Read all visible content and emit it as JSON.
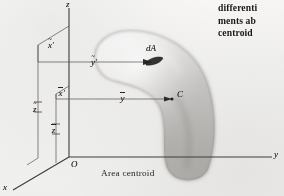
{
  "figure": {
    "caption": "Area centroid",
    "axes": [
      {
        "name": "z-axis",
        "label": "z"
      },
      {
        "name": "y-axis",
        "label": "y"
      },
      {
        "name": "x-axis",
        "label": "x"
      }
    ],
    "origin": {
      "label": "O"
    },
    "element": {
      "area_label": "dA",
      "x_label": "x",
      "y_label": "y",
      "z_label": "z",
      "x_accent": "~",
      "y_accent": "~",
      "z_accent": "~",
      "x_prime": "′",
      "y_prime": "′"
    },
    "centroid": {
      "point_label": "C",
      "x_label": "x",
      "y_label": "y",
      "z_label": "z",
      "x_accent": "–",
      "y_accent": "–",
      "z_accent": "–",
      "x_prime": "′"
    },
    "colors": {
      "ink": "#1b1a18",
      "line": "#3c3a36",
      "surface_light": "#efedea",
      "surface_mid": "#d2cfc9",
      "surface_dark": "#b4b0a9",
      "paper": "#fdfcfa"
    }
  },
  "body_text": {
    "lines": [
      "differenti",
      "ments ab",
      "centroid"
    ]
  }
}
